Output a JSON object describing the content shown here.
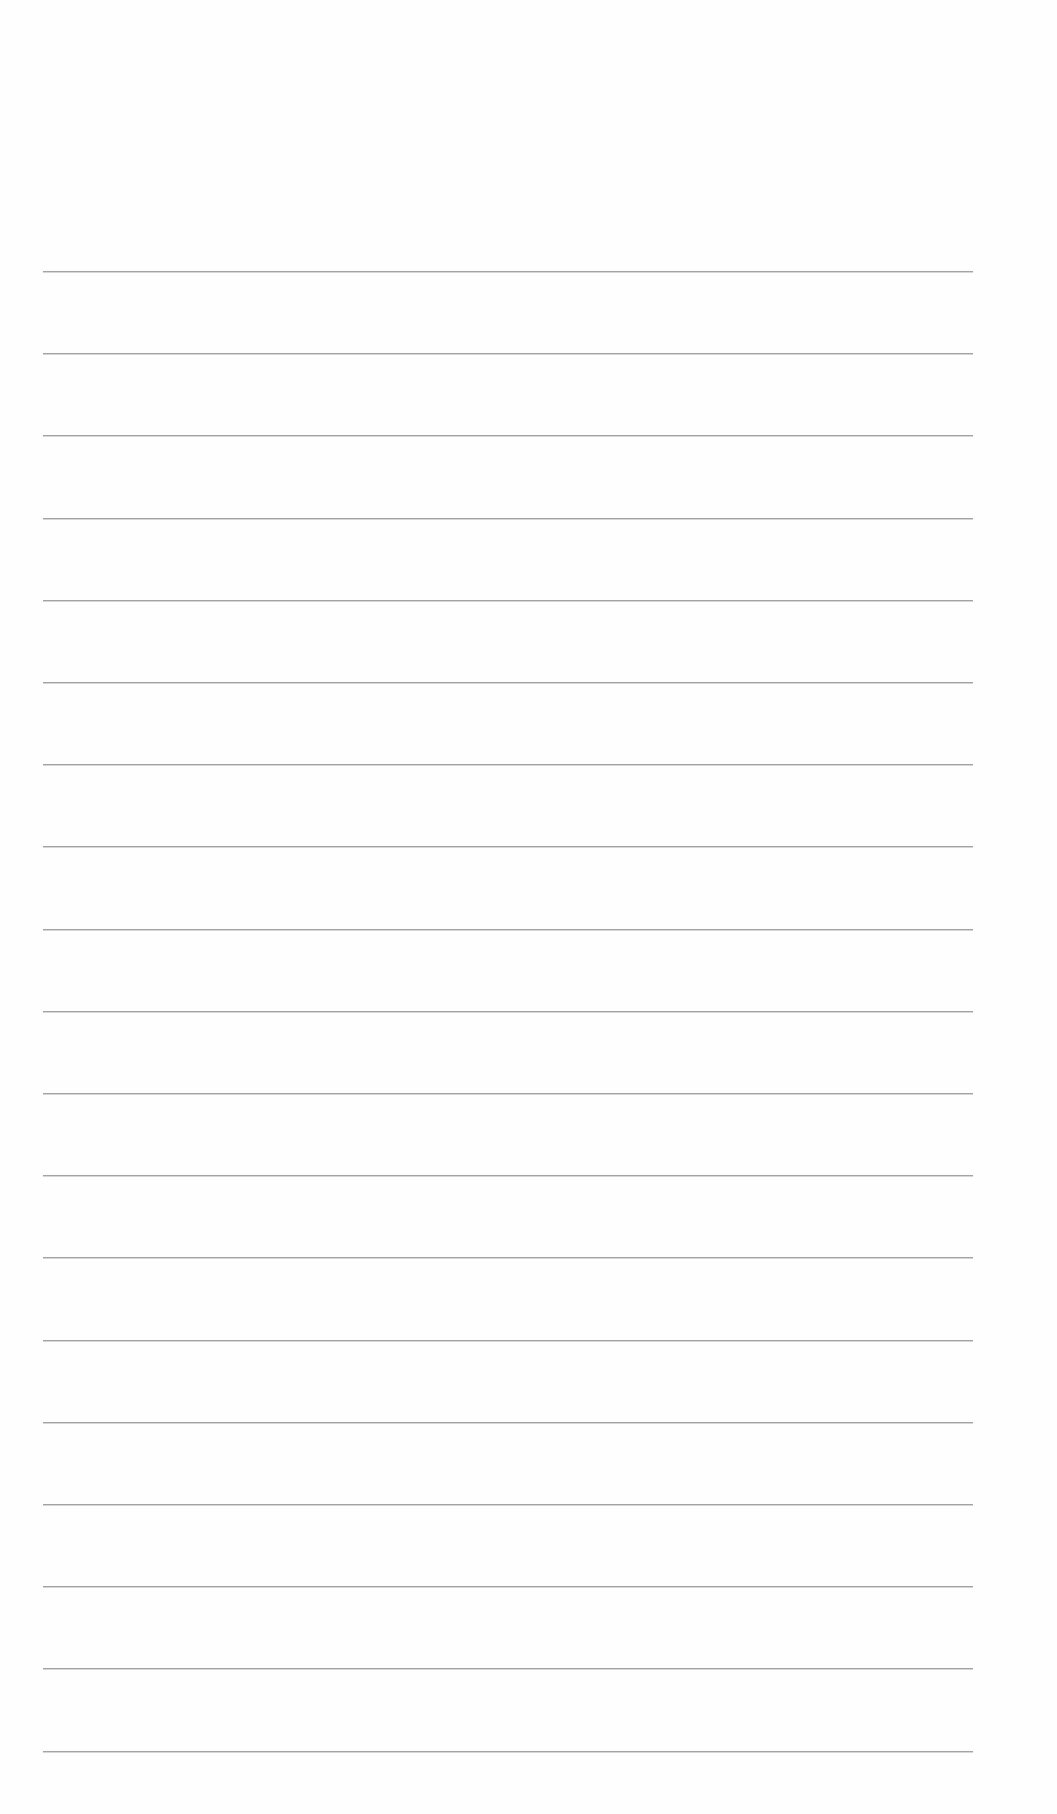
{
  "page": {
    "type": "lined-paper",
    "background_color": "#fefefe",
    "line_color": "#a3a3a3",
    "line_count": 19,
    "first_line_y": 271,
    "line_spacing": 82.2,
    "line_left_x": 43,
    "line_right_x": 973,
    "text": ""
  }
}
